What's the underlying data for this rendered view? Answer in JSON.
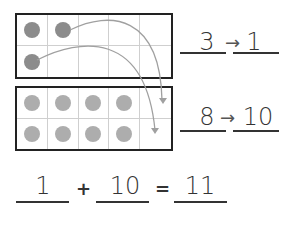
{
  "top_frame": {
    "dots": [
      1,
      1,
      0,
      0,
      0,
      1,
      0,
      0,
      0,
      0
    ],
    "dot_color": "#8c8c8c"
  },
  "bottom_frame": {
    "dots": [
      1,
      1,
      1,
      1,
      0,
      1,
      1,
      1,
      1,
      0
    ],
    "dot_color": "#adadad"
  },
  "row1": {
    "from": "3",
    "arrow": "→",
    "to": "1"
  },
  "row2": {
    "from": "8",
    "arrow": "→",
    "to": "10"
  },
  "equation": {
    "a": "1",
    "plus": "+",
    "b": "10",
    "equals": "=",
    "result": "11"
  }
}
